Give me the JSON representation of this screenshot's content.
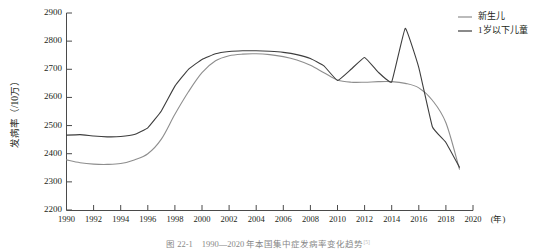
{
  "chart_data": {
    "type": "line",
    "title": "",
    "xlabel": "(年)",
    "ylabel": "发病率（/10万）",
    "xlim": [
      1990,
      2020
    ],
    "ylim": [
      2200,
      2900
    ],
    "grid": false,
    "legend_position": "top-right",
    "x_ticks": [
      1990,
      1992,
      1994,
      1996,
      1998,
      2000,
      2002,
      2004,
      2006,
      2008,
      2010,
      2012,
      2014,
      2016,
      2018,
      2020
    ],
    "y_ticks": [
      2200,
      2300,
      2400,
      2500,
      2600,
      2700,
      2800,
      2900
    ],
    "x": [
      1990,
      1991,
      1992,
      1993,
      1994,
      1995,
      1996,
      1997,
      1998,
      1999,
      2000,
      2001,
      2002,
      2003,
      2004,
      2005,
      2006,
      2007,
      2008,
      2009,
      2010,
      2011,
      2012,
      2013,
      2014,
      2015,
      2016,
      2017,
      2018,
      2019
    ],
    "series": [
      {
        "name": "新生儿",
        "color": "#8e8e8e",
        "values": [
          2378,
          2368,
          2363,
          2362,
          2365,
          2378,
          2400,
          2452,
          2540,
          2620,
          2688,
          2730,
          2748,
          2754,
          2755,
          2752,
          2745,
          2733,
          2714,
          2688,
          2662,
          2654,
          2654,
          2656,
          2656,
          2650,
          2634,
          2590,
          2510,
          2345
        ]
      },
      {
        "name": "1岁以下儿童",
        "color": "#3d3d3d",
        "values": [
          2466,
          2468,
          2463,
          2460,
          2461,
          2468,
          2492,
          2552,
          2640,
          2700,
          2735,
          2755,
          2763,
          2766,
          2766,
          2764,
          2760,
          2752,
          2738,
          2712,
          2660,
          2700,
          2742,
          2690,
          2655,
          2846,
          2706,
          2496,
          2440,
          2352
        ]
      }
    ]
  },
  "legend": {
    "items": [
      {
        "label": "新生儿"
      },
      {
        "label": "1岁以下儿童"
      }
    ]
  },
  "caption": {
    "text": "图 22-1　1990—2020 年本国集中症发病率变化趋势",
    "reference": "[5]"
  }
}
